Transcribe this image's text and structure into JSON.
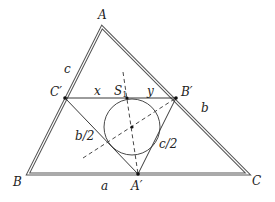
{
  "diagram": {
    "type": "geometry",
    "points": {
      "A": {
        "label": "A",
        "x": 102,
        "y": 27
      },
      "B": {
        "label": "B",
        "x": 28,
        "y": 174
      },
      "C": {
        "label": "C",
        "x": 248,
        "y": 174
      },
      "A_prime": {
        "label": "A′",
        "x": 138,
        "y": 174
      },
      "B_prime": {
        "label": "B′",
        "x": 176,
        "y": 98
      },
      "C_prime": {
        "label": "C′",
        "x": 65,
        "y": 98
      },
      "S1": {
        "label": "S",
        "sub": "1",
        "x": 127,
        "y": 98
      },
      "I": {
        "x": 132,
        "y": 127
      }
    },
    "circle": {
      "cx": 132,
      "cy": 127,
      "r": 28
    },
    "side_labels": {
      "a": "a",
      "b": "b",
      "c": "c",
      "x": "x",
      "y": "y",
      "b_half": "b/2",
      "c_half": "c/2"
    },
    "colors": {
      "outer_triangle": "#555555",
      "lines": "#222222",
      "background": "#ffffff"
    }
  }
}
